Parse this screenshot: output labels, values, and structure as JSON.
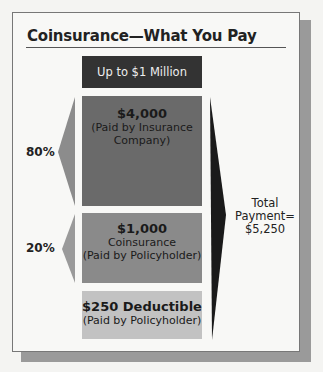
{
  "title": "Coinsurance—What You Pay",
  "boxes": {
    "limit": "Up to $1 Million",
    "insurer": {
      "amount": "$4,000",
      "line1": "(Paid by Insurance",
      "line2": "Company)"
    },
    "coinsurance": {
      "amount": "$1,000",
      "line1": "Coinsurance",
      "line2": "(Paid by Policyholder)"
    },
    "deductible": {
      "amount": "$250 Deductible",
      "line1": "(Paid by Policyholder)"
    }
  },
  "percentages": {
    "insurer": "80%",
    "policyholder": "20%"
  },
  "total": {
    "line1": "Total",
    "line2": "Payment=",
    "line3": "$5,250"
  },
  "colors": {
    "limit_box": "#333333",
    "insurer_box": "#6a6a6a",
    "coinsurance_box": "#8a8a8a",
    "deductible_box": "#c2c2c2",
    "left_arrows": "#8c8c8c",
    "right_arrow": "#1a1a1a"
  }
}
